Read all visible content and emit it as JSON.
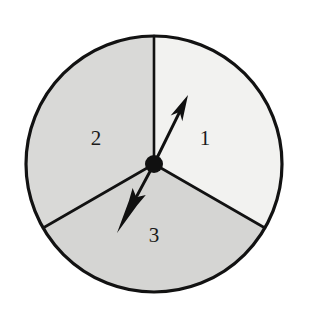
{
  "figure": {
    "kind": "probability-spinner",
    "canvas": {
      "width": 321,
      "height": 313,
      "background": "#ffffff"
    }
  },
  "chart_data": {
    "type": "pie",
    "title": "",
    "xlabel": "",
    "ylabel": "",
    "legend": "none",
    "grid": false,
    "categories": [
      "1",
      "2",
      "3"
    ],
    "values": [
      1,
      1,
      1
    ],
    "percentages": [
      33.3,
      33.3,
      33.3
    ],
    "angles_deg": [
      120,
      120,
      120
    ],
    "slice_start_angles_deg": [
      -30,
      90,
      210
    ],
    "slice_end_angles_deg": [
      90,
      210,
      330
    ],
    "colors": [
      "#f2f2f0",
      "#d9d9d7",
      "#d5d5d3"
    ],
    "labels": [
      "1",
      "2",
      "3"
    ]
  },
  "circle": {
    "center_x": 154,
    "center_y": 164,
    "radius": 128,
    "stroke_color": "#121212",
    "stroke_width": 3.2
  },
  "sectors": [
    {
      "id": "sector-1",
      "label": "1",
      "fill": "#f2f2f0",
      "start_deg": -30,
      "end_deg": 90,
      "label_x": 205,
      "label_y": 138
    },
    {
      "id": "sector-2",
      "label": "2",
      "fill": "#d9d9d7",
      "start_deg": 90,
      "end_deg": 210,
      "label_x": 96,
      "label_y": 138
    },
    {
      "id": "sector-3",
      "label": "3",
      "fill": "#d5d5d3",
      "start_deg": 210,
      "end_deg": 330,
      "label_x": 154,
      "label_y": 235
    }
  ],
  "dividers": [
    {
      "id": "divider-up",
      "angle_deg": 90,
      "end_x": 154,
      "end_y": 36
    },
    {
      "id": "divider-lower-left",
      "angle_deg": 210,
      "end_x": 43,
      "end_y": 228
    },
    {
      "id": "divider-lower-right",
      "angle_deg": 330,
      "end_x": 265,
      "end_y": 228
    }
  ],
  "hub": {
    "center_x": 154,
    "center_y": 164,
    "radius": 9,
    "fill": "#101010"
  },
  "pointer": {
    "id": "pointer-arrow",
    "direction": "up-right",
    "tail_x": 154,
    "tail_y": 164,
    "tip_x": 188,
    "tip_y": 95,
    "color": "#101010",
    "shaft_width": 3,
    "points_into_sector": "1"
  },
  "tail_arrow": {
    "id": "fletched-arrow",
    "direction": "down-left",
    "tail_x": 154,
    "tail_y": 164,
    "tip_x": 117,
    "tip_y": 233,
    "color": "#101010",
    "shaft_width": 3,
    "points_into_sector": "3"
  }
}
